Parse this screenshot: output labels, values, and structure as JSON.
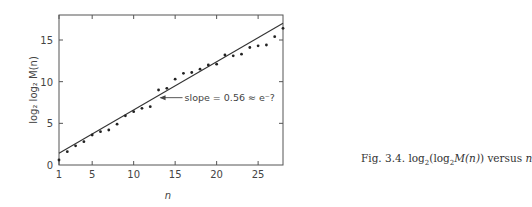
{
  "chart_data": {
    "type": "scatter",
    "title": "",
    "xlabel": "n",
    "ylabel": "log2 log2 M(n)",
    "xlim": [
      1,
      28
    ],
    "ylim": [
      0,
      18
    ],
    "xticks": [
      1,
      5,
      10,
      15,
      20,
      25
    ],
    "yticks": [
      0,
      5,
      10,
      15
    ],
    "grid": false,
    "legend": null,
    "series": [
      {
        "name": "data",
        "kind": "points",
        "x": [
          1,
          2,
          3,
          4,
          5,
          6,
          7,
          8,
          9,
          10,
          11,
          12,
          13,
          14,
          15,
          16,
          17,
          18,
          19,
          20,
          21,
          22,
          23,
          24,
          25,
          26,
          27,
          28
        ],
        "y": [
          0.6,
          1.6,
          2.3,
          2.8,
          3.6,
          4.0,
          4.2,
          4.9,
          5.9,
          6.4,
          6.8,
          7.0,
          9.0,
          9.2,
          10.3,
          11.0,
          11.1,
          11.5,
          12.0,
          12.1,
          13.2,
          13.1,
          13.3,
          14.1,
          14.3,
          14.4,
          15.4,
          16.4
        ]
      },
      {
        "name": "fit",
        "kind": "line",
        "x": [
          1,
          28
        ],
        "y": [
          1.4,
          17.0
        ]
      }
    ],
    "annotations": [
      {
        "text": "slope = 0.56 ≈ e⁻?",
        "arrow_to": [
          13.0,
          8.2
        ]
      }
    ]
  },
  "labels": {
    "ylabel_text": "log₂ log₂ M(n)",
    "xlabel_text": "n",
    "annotation": "slope = 0.56 ≈ e⁻?"
  },
  "caption": {
    "prefix": "Fig. 3.4. ",
    "log": "log",
    "sub": "2",
    "open": "(log",
    "sub2": "2",
    "mn": "M(n)",
    "close": ") versus ",
    "n": "n"
  }
}
